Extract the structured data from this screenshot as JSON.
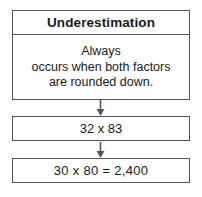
{
  "diagram": {
    "type": "flowchart",
    "orientation": "vertical",
    "background_color": "#ffffff",
    "border_color": "#555555",
    "text_color": "#1a1a1a",
    "definition_box": {
      "header": "Underestimation",
      "body_lines": [
        "Always",
        "occurs when both factors",
        "are rounded down."
      ],
      "body_text": "Always occurs when both factors are rounded down."
    },
    "problem_box": {
      "text": "32 x 83"
    },
    "answer_box": {
      "text": "30 x 80  =  2,400"
    },
    "arrows": [
      {
        "name": "arrow-definition-to-problem",
        "direction": "down"
      },
      {
        "name": "arrow-problem-to-answer",
        "direction": "down"
      }
    ]
  }
}
